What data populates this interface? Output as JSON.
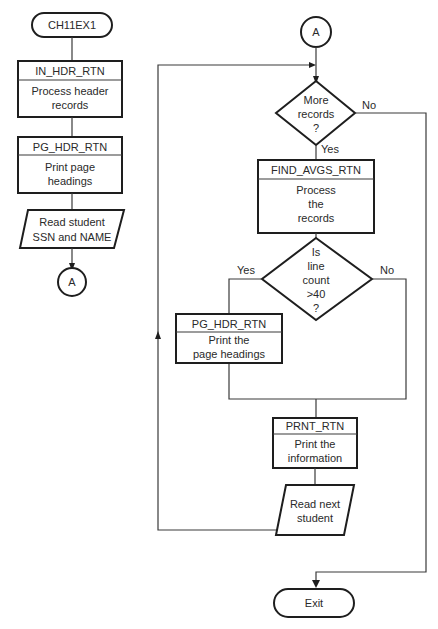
{
  "colors": {
    "line": "#1e1e1e",
    "text": "#2a2a2a",
    "background": "#ffffff"
  },
  "left_chart": {
    "start_terminal": "CH11EX1",
    "in_hdr": {
      "name": "IN_HDR_RTN",
      "line1": "Process header",
      "line2": "records"
    },
    "pg_hdr": {
      "name": "PG_HDR_RTN",
      "line1": "Print page",
      "line2": "headings"
    },
    "read_input": {
      "line1": "Read student",
      "line2": "SSN and NAME"
    },
    "connector": "A"
  },
  "right_chart": {
    "connector": "A",
    "decision_more": {
      "line1": "More",
      "line2": "records",
      "line3": "?",
      "yes": "Yes",
      "no": "No"
    },
    "find_avgs": {
      "name": "FIND_AVGS_RTN",
      "line1": "Process",
      "line2": "the",
      "line3": "records"
    },
    "decision_line": {
      "line1": "Is",
      "line2": "line",
      "line3": "count",
      "line4": ">40",
      "line5": "?",
      "yes": "Yes",
      "no": "No"
    },
    "pg_hdr": {
      "name": "PG_HDR_RTN",
      "line1": "Print the",
      "line2": "page headings"
    },
    "prnt": {
      "name": "PRNT_RTN",
      "line1": "Print the",
      "line2": "information"
    },
    "read_next": {
      "line1": "Read next",
      "line2": "student"
    },
    "exit_terminal": "Exit"
  }
}
